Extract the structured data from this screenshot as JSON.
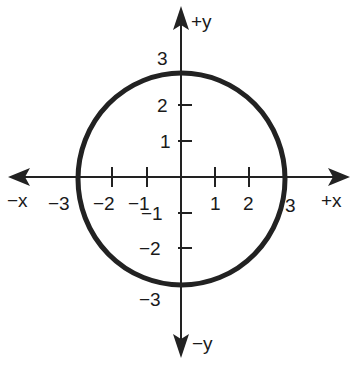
{
  "diagram": {
    "type": "coordinate-plane-circle",
    "circle": {
      "center": [
        0,
        0
      ],
      "radius": 3,
      "stroke": "#222222"
    },
    "axes": {
      "x_positive_label": "+x",
      "x_negative_label": "−x",
      "y_positive_label": "+y",
      "y_negative_label": "−y"
    },
    "x_ticks": [
      {
        "value": -3,
        "label": "−3"
      },
      {
        "value": -2,
        "label": "−2"
      },
      {
        "value": -1,
        "label": "−1"
      },
      {
        "value": 1,
        "label": "1"
      },
      {
        "value": 2,
        "label": "2"
      },
      {
        "value": 3,
        "label": "3"
      }
    ],
    "y_ticks": [
      {
        "value": 3,
        "label": "3"
      },
      {
        "value": 2,
        "label": "2"
      },
      {
        "value": 1,
        "label": "1"
      },
      {
        "value": -1,
        "label": "−1"
      },
      {
        "value": -2,
        "label": "−2"
      },
      {
        "value": -3,
        "label": "−3"
      }
    ]
  }
}
